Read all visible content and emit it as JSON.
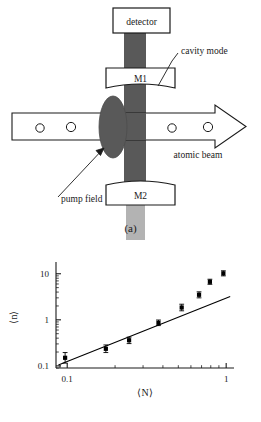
{
  "figure": {
    "panels": [
      {
        "id": "a",
        "caption": "(a)",
        "type": "schematic",
        "elements": {
          "detector_label": "detector",
          "mirror_top_label": "M1",
          "mirror_bottom_label": "M2",
          "cavity_mode_label": "cavity mode",
          "pump_field_label": "pump field",
          "atomic_beam_label": "atomic beam"
        },
        "colors": {
          "cavity_mode_fill": "#595959",
          "pump_field_fill": "#595959",
          "lower_beam_fill": "#b3b3b3",
          "stroke": "#1a1a1a",
          "background": "#ffffff"
        },
        "atom_count": 4
      },
      {
        "id": "b",
        "caption": "(b)",
        "type": "chart"
      }
    ]
  },
  "chart_data": {
    "type": "scatter",
    "title": "",
    "xlabel": "⟨N⟩",
    "ylabel": "⟨n⟩",
    "xscale": "log",
    "yscale": "log",
    "xlim": [
      0.085,
      1.12
    ],
    "ylim": [
      0.09,
      18
    ],
    "xticks": [
      0.1,
      1
    ],
    "xtick_labels": [
      "0.1",
      "1"
    ],
    "yticks": [
      0.1,
      1,
      10
    ],
    "ytick_labels": [
      "0.1",
      "1",
      "10"
    ],
    "grid": false,
    "legend": null,
    "series": [
      {
        "name": "measured mean photon number",
        "marker": "square",
        "color": "#000000",
        "points": [
          {
            "x": 0.097,
            "y": 0.15,
            "yerr_low": 0.035,
            "yerr_high": 0.045
          },
          {
            "x": 0.175,
            "y": 0.235,
            "yerr_low": 0.04,
            "yerr_high": 0.05
          },
          {
            "x": 0.245,
            "y": 0.36,
            "yerr_low": 0.055,
            "yerr_high": 0.06
          },
          {
            "x": 0.375,
            "y": 0.86,
            "yerr_low": 0.11,
            "yerr_high": 0.13
          },
          {
            "x": 0.525,
            "y": 1.85,
            "yerr_low": 0.28,
            "yerr_high": 0.33
          },
          {
            "x": 0.675,
            "y": 3.5,
            "yerr_low": 0.5,
            "yerr_high": 0.55
          },
          {
            "x": 0.79,
            "y": 6.7,
            "yerr_low": 0.8,
            "yerr_high": 0.9
          },
          {
            "x": 0.96,
            "y": 10.2,
            "yerr_low": 1.2,
            "yerr_high": 1.4
          }
        ]
      },
      {
        "name": "linear fit",
        "type": "line",
        "color": "#000000",
        "x": [
          0.088,
          1.06
        ],
        "y": [
          0.105,
          3.2
        ]
      }
    ]
  }
}
